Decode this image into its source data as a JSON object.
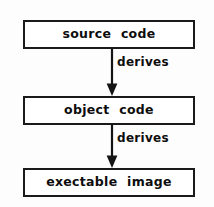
{
  "diagram": {
    "type": "flowchart",
    "orientation": "vertical-top-down",
    "accent_color": "#141414",
    "background_color": "#fdfdfd",
    "nodes": [
      {
        "id": "source-code",
        "label": "source  code"
      },
      {
        "id": "object-code",
        "label": "object  code"
      },
      {
        "id": "exectable-image",
        "label": "exectable  image"
      }
    ],
    "edges": [
      {
        "id": "source-to-object",
        "label": "derives",
        "from": "source-code",
        "to": "object-code",
        "arrowhead": "solid-triangle-down"
      },
      {
        "id": "object-to-exec",
        "label": "derives",
        "from": "object-code",
        "to": "exectable-image",
        "arrowhead": "solid-triangle-down"
      }
    ]
  }
}
